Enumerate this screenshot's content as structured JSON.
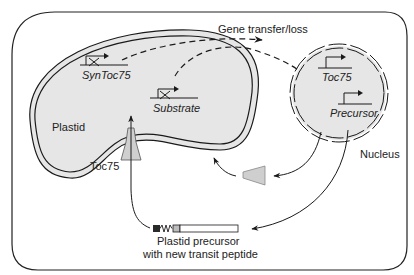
{
  "diagram": {
    "labels": {
      "gene_transfer": "Gene transfer/loss",
      "plastid": "Plastid",
      "nucleus": "Nucleus",
      "toc75_channel": "Toc75",
      "precursor_line1": "Plastid precursor",
      "precursor_line2": "with new transit peptide"
    },
    "plastid_genes": [
      {
        "name": "SynToc75",
        "state": "lost"
      },
      {
        "name": "Substrate",
        "state": "lost"
      }
    ],
    "nuclear_genes": [
      {
        "name": "Toc75",
        "state": "expressed"
      },
      {
        "name": "Precursor",
        "state": "expressed"
      }
    ],
    "colors": {
      "compartment_fill": "#e6e6e6",
      "line": "#1a1a1a",
      "toc75_fill": "#cfcfcf",
      "transit_dark": "#2a2a2a",
      "transit_light": "#bdbdbd"
    }
  }
}
